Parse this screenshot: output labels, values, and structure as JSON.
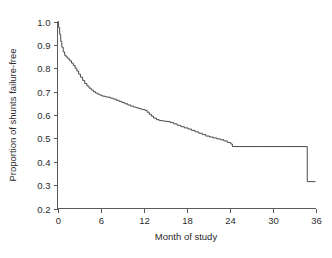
{
  "chart_data": {
    "type": "line",
    "title": "",
    "subtitle": "",
    "xlabel": "Month of study",
    "ylabel": "Proportion of shunts failure-free",
    "xlim": [
      0,
      36
    ],
    "ylim": [
      0.2,
      1.0
    ],
    "xticks": [
      0,
      6,
      12,
      18,
      24,
      30,
      36
    ],
    "xtick_labels": [
      "0",
      "6",
      "12",
      "18",
      "24",
      "30",
      "36"
    ],
    "yticks": [
      0.2,
      0.3,
      0.4,
      0.5,
      0.6,
      0.7,
      0.8,
      0.9,
      1.0
    ],
    "ytick_labels": [
      "0.2",
      "0.3",
      "0.4",
      "0.5",
      "0.6",
      "0.7",
      "0.8",
      "0.9",
      "1.0"
    ],
    "grid": false,
    "legend": null,
    "line_color": "#4a4a4a",
    "axis_color": "#5a5a5a",
    "series": [
      {
        "name": "Shunt survival (Kaplan-Meier)",
        "step": "post",
        "x": [
          0.0,
          0.15,
          0.3,
          0.45,
          0.6,
          0.8,
          1.0,
          1.2,
          1.45,
          1.7,
          1.95,
          2.2,
          2.45,
          2.7,
          2.95,
          3.2,
          3.5,
          3.8,
          4.1,
          4.4,
          4.7,
          5.0,
          5.3,
          5.6,
          5.9,
          6.2,
          6.6,
          7.0,
          7.4,
          7.8,
          8.2,
          8.6,
          9.0,
          9.4,
          9.8,
          10.2,
          10.6,
          11.0,
          11.3,
          11.6,
          11.9,
          12.2,
          12.5,
          12.8,
          13.1,
          13.4,
          13.8,
          14.2,
          14.7,
          15.2,
          15.7,
          16.2,
          16.7,
          17.2,
          17.7,
          18.2,
          18.7,
          19.2,
          19.7,
          20.2,
          20.7,
          21.2,
          21.7,
          22.2,
          22.7,
          23.2,
          23.7,
          24.2,
          24.4,
          28.0,
          32.0,
          34.8,
          34.85,
          36.0
        ],
        "y": [
          1.0,
          0.975,
          0.945,
          0.915,
          0.89,
          0.87,
          0.855,
          0.848,
          0.84,
          0.832,
          0.822,
          0.812,
          0.8,
          0.788,
          0.775,
          0.762,
          0.748,
          0.735,
          0.724,
          0.715,
          0.707,
          0.7,
          0.694,
          0.689,
          0.685,
          0.681,
          0.678,
          0.676,
          0.672,
          0.668,
          0.663,
          0.658,
          0.653,
          0.648,
          0.643,
          0.638,
          0.634,
          0.631,
          0.628,
          0.625,
          0.623,
          0.62,
          0.612,
          0.603,
          0.595,
          0.587,
          0.58,
          0.576,
          0.574,
          0.572,
          0.568,
          0.562,
          0.556,
          0.55,
          0.545,
          0.54,
          0.534,
          0.528,
          0.522,
          0.516,
          0.51,
          0.506,
          0.502,
          0.498,
          0.494,
          0.489,
          0.482,
          0.476,
          0.465,
          0.465,
          0.465,
          0.465,
          0.315,
          0.315
        ]
      }
    ],
    "annotations": [
      {
        "label": "initial-steep-decline",
        "x_range": [
          0,
          1
        ],
        "y_range": [
          1.0,
          0.855
        ]
      },
      {
        "label": "plateau-after-month-24",
        "x_range": [
          24.4,
          34.8
        ],
        "value": 0.465
      },
      {
        "label": "terminal-drop",
        "x": 34.8,
        "from": 0.465,
        "to": 0.315
      }
    ]
  },
  "axes": {
    "x_title": "Month of study",
    "y_title": "Proportion of shunts failure-free"
  }
}
